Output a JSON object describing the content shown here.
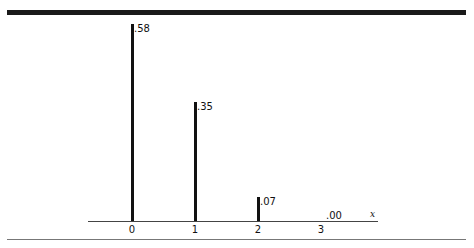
{
  "chart_data": {
    "type": "bar",
    "style": "stem",
    "title": "",
    "xlabel": "x",
    "ylabel": "",
    "categories": [
      "0",
      "1",
      "2",
      "3"
    ],
    "values": [
      0.58,
      0.35,
      0.07,
      0.0
    ],
    "value_labels": [
      ".58",
      ".35",
      ".07",
      ".00"
    ],
    "ylim": [
      0,
      0.6
    ],
    "grid": false,
    "legend": null
  },
  "layout": {
    "baseline_y": 221,
    "top_y_for_058": 24,
    "bar_x": [
      131,
      194,
      257,
      320
    ]
  }
}
